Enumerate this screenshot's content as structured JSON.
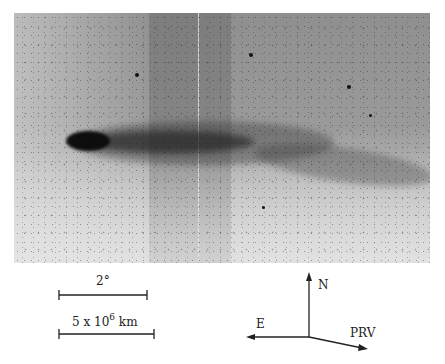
{
  "figure": {
    "type": "comet photograph (negative print)",
    "scale_bars": [
      {
        "label": "2°"
      },
      {
        "label_prefix": "5 x 10",
        "label_exponent": "6",
        "label_suffix": " km"
      }
    ],
    "compass": {
      "north": "N",
      "east": "E",
      "direction": "PRV"
    }
  }
}
